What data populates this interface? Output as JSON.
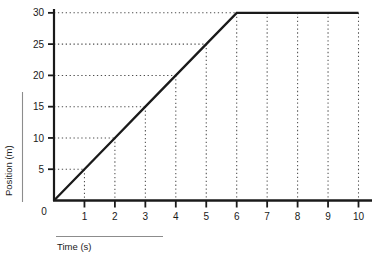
{
  "chart_data": {
    "type": "line",
    "title": "",
    "xlabel": "Time (s)",
    "ylabel": "Position (m)",
    "xlim": [
      0,
      10
    ],
    "ylim": [
      0,
      30
    ],
    "grid": "dotted-guides",
    "legend": "none",
    "x_ticks": [
      "1",
      "2",
      "3",
      "4",
      "5",
      "6",
      "7",
      "8",
      "9",
      "10"
    ],
    "x_tick_values": [
      1,
      2,
      3,
      4,
      5,
      6,
      7,
      8,
      9,
      10
    ],
    "y_ticks": [
      "0",
      "5",
      "10",
      "15",
      "20",
      "25",
      "30"
    ],
    "y_tick_values": [
      0,
      5,
      10,
      15,
      20,
      25,
      30
    ],
    "origin_label": "0",
    "series": [
      {
        "name": "position",
        "color": "#1a1a1a",
        "x": [
          0,
          1,
          2,
          3,
          4,
          5,
          6,
          7,
          8,
          9,
          10
        ],
        "values": [
          0,
          5,
          10,
          15,
          20,
          25,
          30,
          30,
          30,
          30,
          30
        ]
      }
    ],
    "guide_points": [
      {
        "x": 1,
        "y": 5
      },
      {
        "x": 2,
        "y": 10
      },
      {
        "x": 3,
        "y": 15
      },
      {
        "x": 4,
        "y": 20
      },
      {
        "x": 5,
        "y": 25
      },
      {
        "x": 6,
        "y": 30
      },
      {
        "x": 7,
        "y": 30
      },
      {
        "x": 8,
        "y": 30
      },
      {
        "x": 9,
        "y": 30
      },
      {
        "x": 10,
        "y": 30
      }
    ],
    "annotations": []
  },
  "axis": {
    "x_title": "Time (s)",
    "y_title": "Position (m)"
  },
  "ticks": {
    "x": [
      "1",
      "2",
      "3",
      "4",
      "5",
      "6",
      "7",
      "8",
      "9",
      "10"
    ],
    "y": [
      "30",
      "25",
      "20",
      "15",
      "10",
      "5"
    ],
    "origin": "0"
  },
  "colors": {
    "line": "#1a1a1a",
    "axis": "#1a1a1a",
    "grid": "#4d4d4d",
    "background": "#ffffff",
    "rule": "#8c8c8c"
  }
}
